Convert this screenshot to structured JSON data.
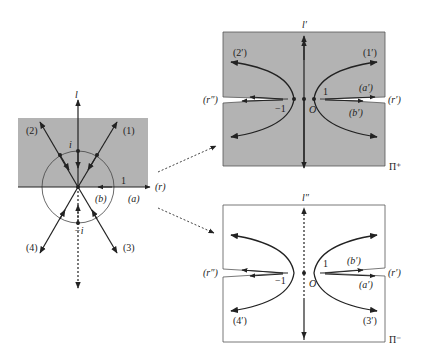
{
  "colors": {
    "shade": "#b3b3b3",
    "line": "#222222",
    "background": "#ffffff"
  },
  "left_panel": {
    "axis_label_top": "l",
    "point_top": "i",
    "point_bottom": "−i",
    "ray_labels": [
      "(1)",
      "(2)",
      "(3)",
      "(4)"
    ],
    "real_axis_label": "(r)",
    "one_label": "1",
    "a_label": "(a)",
    "b_label": "(b)"
  },
  "upper_sheet": {
    "axis_label": "l′",
    "sheet_label": "Π⁺",
    "curve_labels": [
      "(1′)",
      "(2′)"
    ],
    "right_cut_label": "(r′)",
    "left_cut_label": "(r″)",
    "a_label": "(a′)",
    "b_label": "(b′)",
    "one_label": "1",
    "minus_one_label": "−1",
    "origin_label": "O"
  },
  "lower_sheet": {
    "axis_label": "l″",
    "sheet_label": "Π⁻",
    "curve_labels": [
      "(3′)",
      "(4′)"
    ],
    "right_cut_label": "(r′)",
    "left_cut_label": "(r″)",
    "a_label": "(a′)",
    "b_label": "(b′)",
    "one_label": "1",
    "minus_one_label": "−1",
    "origin_label": "O"
  }
}
